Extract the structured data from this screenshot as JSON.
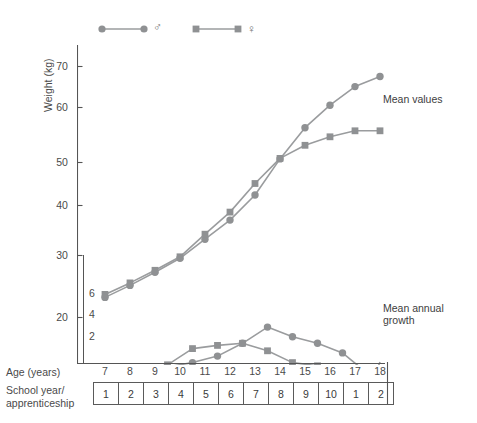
{
  "figure": {
    "legend": [
      {
        "id": "male",
        "symbol": "circle",
        "sex_glyph": "♂",
        "name": "male-series"
      },
      {
        "id": "female",
        "symbol": "square",
        "sex_glyph": "♀",
        "name": "female-series"
      }
    ],
    "annotations": [
      {
        "id": "mean-values",
        "text": "Mean values"
      },
      {
        "id": "mean-annual-growth",
        "text": "Mean annual\ngrowth"
      }
    ],
    "axis_titles": {
      "y_primary": "Weight (kg)",
      "x": "Age (years)",
      "school_row": "School year/\napprenticeship"
    },
    "series_color": "#8f9193",
    "line_color": "#9a9c9e",
    "frame_color": "#555555"
  },
  "chart_data": {
    "type": "line",
    "title": "",
    "xlabel": "Age (years)",
    "ylabel": "Weight (kg)",
    "xlim": [
      6.5,
      18.5
    ],
    "ylim": [
      14,
      72
    ],
    "grid": false,
    "legend_position": "top-left",
    "x_ticks": [
      7,
      8,
      9,
      10,
      11,
      12,
      13,
      14,
      15,
      16,
      17,
      18
    ],
    "y_ticks": [
      20,
      30,
      40,
      50,
      60,
      70
    ],
    "secondary_axis": {
      "label": "Mean annual growth (kg)",
      "ticks": [
        2,
        4,
        6
      ],
      "ylim": [
        0.6,
        8.4
      ],
      "pixel_top_value": 8.4
    },
    "school_year_row": [
      "1",
      "2",
      "3",
      "4",
      "5",
      "6",
      "7",
      "8",
      "9",
      "10",
      "1",
      "2"
    ],
    "series": [
      {
        "name": "Mean values ♂",
        "symbol": "circle",
        "panel": "weight",
        "x": [
          7,
          8,
          9,
          10,
          11,
          12,
          13,
          14,
          15,
          16,
          17,
          18
        ],
        "values": [
          24.0,
          26.4,
          29.0,
          31.8,
          35.6,
          39.4,
          44.4,
          51.6,
          57.8,
          62.3,
          66.0,
          68.0
        ]
      },
      {
        "name": "Mean values ♀",
        "symbol": "square",
        "panel": "weight",
        "x": [
          7,
          8,
          9,
          10,
          11,
          12,
          13,
          14,
          15,
          16,
          17,
          18
        ],
        "values": [
          24.6,
          26.9,
          29.4,
          32.1,
          36.6,
          41.0,
          46.7,
          51.7,
          54.3,
          56.0,
          57.2,
          57.2
        ]
      },
      {
        "name": "Mean annual growth ♂",
        "symbol": "circle",
        "panel": "growth",
        "x": [
          7.5,
          8.5,
          9.5,
          10.5,
          11.5,
          12.5,
          13.5,
          14.5,
          15.5,
          16.5,
          17.5
        ],
        "values": [
          2.4,
          2.6,
          2.8,
          3.2,
          3.8,
          5.0,
          6.5,
          5.6,
          5.0,
          4.1,
          2.2
        ]
      },
      {
        "name": "Mean annual growth ♀",
        "symbol": "square",
        "panel": "growth",
        "x": [
          7.5,
          8.5,
          9.5,
          10.5,
          11.5,
          12.5,
          13.5,
          14.5,
          15.5,
          16.5,
          17.5
        ],
        "values": [
          2.3,
          2.5,
          3.0,
          4.5,
          4.8,
          5.0,
          4.3,
          3.2,
          2.9,
          2.5,
          0.2
        ]
      }
    ]
  }
}
